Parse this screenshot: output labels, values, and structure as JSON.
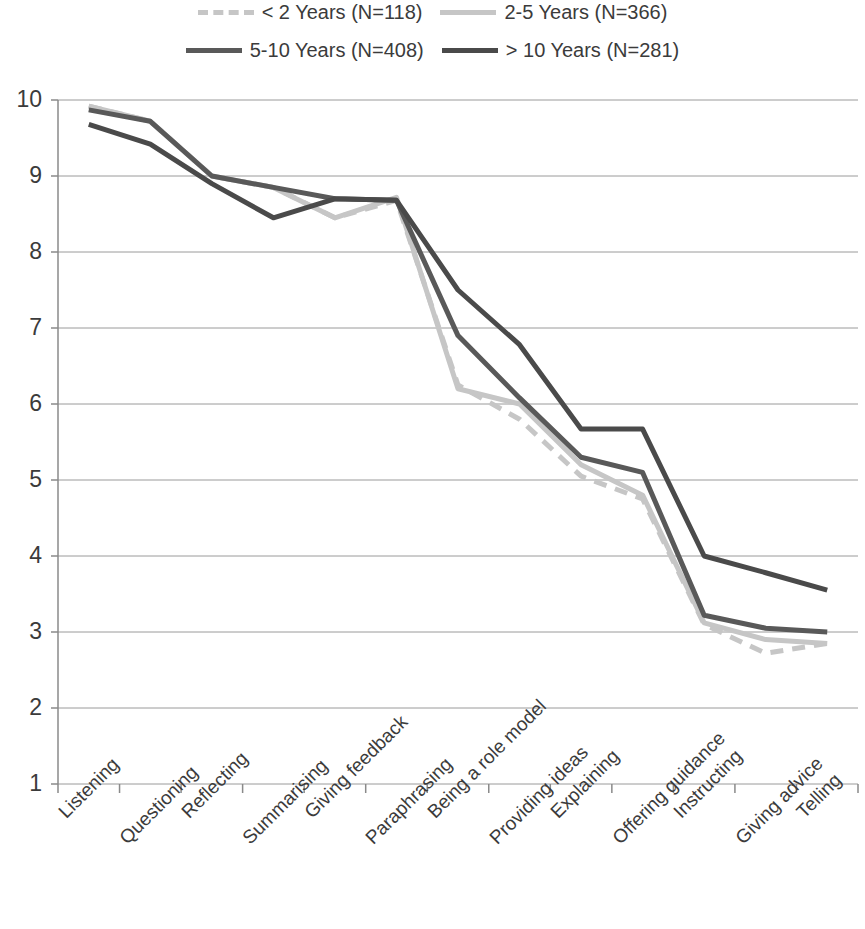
{
  "chart_data": {
    "type": "line",
    "title": "",
    "subtitle": "",
    "xlabel": "",
    "ylabel": "",
    "ylim": [
      1,
      10
    ],
    "yticks": [
      10,
      9,
      8,
      7,
      6,
      5,
      4,
      3,
      2,
      1
    ],
    "grid": "horizontal",
    "legend_position": "top",
    "categories": [
      "Listening",
      "Questioning",
      "Reflecting",
      "Summarising",
      "Giving feedback",
      "Paraphrasing",
      "Being a role model",
      "Providing ideas",
      "Explaining",
      "Offering guidance",
      "Instructing",
      "Giving advice",
      "Telling"
    ],
    "series": [
      {
        "name": "< 2 Years (N=118)",
        "n": 118,
        "color": "#c6c6c6",
        "style": "dashed",
        "width": 5,
        "values": [
          9.92,
          9.72,
          9.0,
          8.85,
          8.45,
          8.68,
          6.25,
          5.8,
          5.05,
          4.75,
          3.1,
          2.72,
          2.85
        ]
      },
      {
        "name": "2-5 Years (N=366)",
        "n": 366,
        "color": "#c6c6c6",
        "style": "solid",
        "width": 5,
        "values": [
          9.92,
          9.72,
          9.0,
          8.85,
          8.45,
          8.72,
          6.2,
          6.0,
          5.2,
          4.8,
          3.12,
          2.9,
          2.85
        ]
      },
      {
        "name": "5-10 Years (N=408)",
        "n": 408,
        "color": "#595959",
        "style": "solid",
        "width": 5,
        "values": [
          9.87,
          9.72,
          9.0,
          8.85,
          8.7,
          8.68,
          6.9,
          6.08,
          5.3,
          5.1,
          3.22,
          3.05,
          3.0
        ]
      },
      {
        "name": "> 10 Years (N=281)",
        "n": 281,
        "color": "#4a4a4a",
        "style": "solid",
        "width": 5,
        "values": [
          9.68,
          9.42,
          8.9,
          8.45,
          8.7,
          8.68,
          7.5,
          6.78,
          5.67,
          5.67,
          4.0,
          3.78,
          3.55
        ]
      }
    ]
  },
  "legend": {
    "row1": [
      {
        "label": "< 2 Years (N=118)",
        "swatch": "dashed-light-line-swatch"
      },
      {
        "label": "2-5 Years (N=366)",
        "swatch": "solid-light-line-swatch"
      }
    ],
    "row2": [
      {
        "label": "5-10 Years (N=408)",
        "swatch": "solid-dark-line-swatch"
      },
      {
        "label": "> 10 Years (N=281)",
        "swatch": "solid-darker-line-swatch"
      }
    ]
  }
}
